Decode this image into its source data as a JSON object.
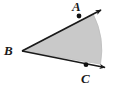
{
  "figure": {
    "kind": "geometry-angle-diagram",
    "canvas": {
      "width": 117,
      "height": 87,
      "background": "#ffffff"
    },
    "colors": {
      "sector_fill": "#c9c9c9",
      "sector_arc_stroke": "#b4b4b4",
      "ray_stroke": "#1a1a1a",
      "point_fill": "#111111",
      "label_color": "#1a1a1a"
    },
    "labels": [
      {
        "name": "A",
        "text": "A",
        "x": 72,
        "y": 0
      },
      {
        "name": "B",
        "text": "B",
        "x": 4,
        "y": 44
      },
      {
        "name": "C",
        "text": "C",
        "x": 81,
        "y": 72
      }
    ],
    "points": [
      {
        "name": "A",
        "x": 79,
        "y": 15,
        "r": 2.4
      },
      {
        "name": "B",
        "x": 22,
        "y": 51,
        "r": 0
      },
      {
        "name": "C",
        "x": 86,
        "y": 65,
        "r": 2.4
      }
    ],
    "rays": [
      {
        "name": "ray-BA",
        "from": "B",
        "through": "A",
        "x1": 22,
        "y1": 51,
        "x2": 103,
        "y2": 9,
        "arrow": true
      },
      {
        "name": "ray-BC",
        "from": "B",
        "through": "C",
        "x1": 22,
        "y1": 51,
        "x2": 108,
        "y2": 68,
        "arrow": true
      }
    ],
    "sector": {
      "name": "shaded-sector",
      "vertex": {
        "x": 22,
        "y": 51
      },
      "radius": 75,
      "start": {
        "x": 92,
        "y": 24
      },
      "end": {
        "x": 90,
        "y": 67
      },
      "sweep_direction": "clockwise-from-upper-ray-to-lower-ray"
    }
  }
}
